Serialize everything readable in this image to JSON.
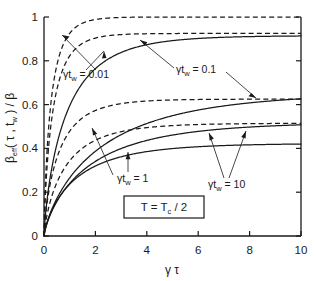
{
  "figure": {
    "background": "#ffffff",
    "ink_color": "#1a1a1a"
  },
  "chart_data": {
    "type": "line",
    "title": "",
    "xlabel": "γ τ",
    "ylabel": "β_eff( τ , t_w ) / β",
    "xlim": [
      0,
      10
    ],
    "ylim": [
      0,
      1
    ],
    "xticks": [
      0,
      2,
      4,
      6,
      8,
      10
    ],
    "yticks": [
      0,
      0.2,
      0.4,
      0.6,
      0.8,
      1
    ],
    "xticklabels": [
      "0",
      "2",
      "4",
      "6",
      "8",
      "10"
    ],
    "yticklabels": [
      "0",
      "0.2",
      "0.4",
      "0.6",
      "0.8",
      "1"
    ],
    "grid": false,
    "legend": "none",
    "annotation_box": "T = T_c / 2",
    "series": [
      {
        "name": "gamma_tw = 0.01 (dashed)",
        "style": "dashed",
        "plateau": 1.0,
        "rate": 2.6,
        "group": "0.01"
      },
      {
        "name": "gamma_tw = 0.01 (solid)",
        "style": "solid",
        "plateau": 0.915,
        "rate": 1.05,
        "group": "0.01"
      },
      {
        "name": "gamma_tw = 0.1 (dashed)",
        "style": "dashed",
        "plateau": 0.925,
        "rate": 2.2,
        "group": "0.1"
      },
      {
        "name": "gamma_tw = 0.1 (solid)",
        "style": "solid",
        "plateau": 0.655,
        "rate": 0.52,
        "group": "0.1"
      },
      {
        "name": "gamma_tw = 1 (dashed)",
        "style": "dashed",
        "plateau": 0.625,
        "rate": 1.45,
        "group": "1"
      },
      {
        "name": "gamma_tw = 1 (solid)",
        "style": "solid",
        "plateau": 0.52,
        "rate": 0.62,
        "group": "1"
      },
      {
        "name": "gamma_tw = 10 (dashed)",
        "style": "dashed",
        "plateau": 0.515,
        "rate": 1.1,
        "group": "10"
      },
      {
        "name": "gamma_tw = 10 (solid)",
        "style": "solid",
        "plateau": 0.423,
        "rate": 0.82,
        "group": "10"
      }
    ],
    "annotations": [
      {
        "id": "a1",
        "text_prefix": "γt",
        "text_sub": "w",
        "text_suffix": " = 0.01",
        "value": "0.01"
      },
      {
        "id": "a2",
        "text_prefix": "γt",
        "text_sub": "w",
        "text_suffix": " = 0.1",
        "value": "0.1"
      },
      {
        "id": "a3",
        "text_prefix": "γt",
        "text_sub": "w",
        "text_suffix": " = 1",
        "value": "1"
      },
      {
        "id": "a4",
        "text_prefix": "γt",
        "text_sub": "w",
        "text_suffix": " = 10",
        "value": "10"
      }
    ]
  },
  "labels": {
    "ylabel_main": "β",
    "ylabel_sub": "eff",
    "ylabel_rest": "( τ , t",
    "ylabel_sub2": "w",
    "ylabel_tail": " ) / β",
    "xlabel": "γ τ",
    "box_t": "T = T",
    "box_sub": "c",
    "box_tail": " / 2",
    "tick_y_0": "0",
    "tick_y_1": "0.2",
    "tick_y_2": "0.4",
    "tick_y_3": "0.6",
    "tick_y_4": "0.8",
    "tick_y_5": "1",
    "tick_x_0": "0",
    "tick_x_1": "2",
    "tick_x_2": "4",
    "tick_x_3": "6",
    "tick_x_4": "8",
    "tick_x_5": "10",
    "ann1_pre": "γt",
    "ann1_sub": "w",
    "ann1_post": " = 0.01",
    "ann2_pre": "γt",
    "ann2_sub": "w",
    "ann2_post": " = 0.1",
    "ann3_pre": "γt",
    "ann3_sub": "w",
    "ann3_post": " = 1",
    "ann4_pre": "γt",
    "ann4_sub": "w",
    "ann4_post": " = 10"
  }
}
